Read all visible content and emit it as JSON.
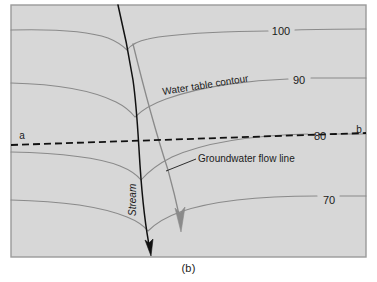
{
  "figure": {
    "caption": "(b)",
    "background_color": "#d7d7d7",
    "frame_color": "#9a9a9a",
    "contour_color": "#8a8a8a",
    "stream_color": "#111111",
    "flowline_color": "#8a8a8a",
    "section_line_color": "#111111"
  },
  "contours": {
    "labels": [
      {
        "value": "100",
        "x": 281,
        "y": 32
      },
      {
        "value": "90",
        "x": 299,
        "y": 81
      },
      {
        "value": "80",
        "x": 320,
        "y": 137
      },
      {
        "value": "70",
        "x": 329,
        "y": 201
      }
    ]
  },
  "section_line": {
    "start_label": "a",
    "end_label": "b",
    "start_label_x": 22,
    "start_label_y": 136,
    "end_label_x": 359,
    "end_label_y": 130
  },
  "annotations": {
    "water_table_contour": "Water table contour",
    "groundwater_flow_line": "Groundwater flow line",
    "stream": "Stream"
  }
}
